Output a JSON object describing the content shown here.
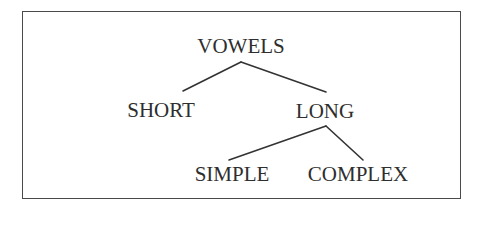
{
  "diagram": {
    "type": "tree",
    "root": {
      "id": "vowels",
      "label": "VOWELS",
      "children": [
        {
          "id": "short",
          "label": "SHORT",
          "children": []
        },
        {
          "id": "long",
          "label": "LONG",
          "children": [
            {
              "id": "simple",
              "label": "SIMPLE",
              "children": []
            },
            {
              "id": "complex",
              "label": "COMPLEX",
              "children": []
            }
          ]
        }
      ]
    },
    "nodes": {
      "vowels": "VOWELS",
      "short": "SHORT",
      "long": "LONG",
      "simple": "SIMPLE",
      "complex": "COMPLEX"
    },
    "edges": [
      {
        "from": "vowels",
        "to": "short"
      },
      {
        "from": "vowels",
        "to": "long"
      },
      {
        "from": "long",
        "to": "simple"
      },
      {
        "from": "long",
        "to": "complex"
      }
    ],
    "colors": {
      "text": "#2e2e2e",
      "line": "#333333",
      "border": "#4a4a4a",
      "background": "#ffffff"
    }
  }
}
